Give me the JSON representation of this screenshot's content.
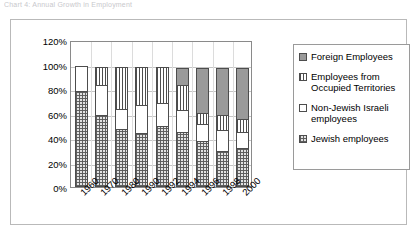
{
  "caption": {
    "text": "Chart 4: Annual Growth in Employment"
  },
  "chart_data": {
    "type": "bar",
    "subtype": "stacked-100",
    "title": "",
    "xlabel": "",
    "ylabel": "",
    "ylim": [
      0,
      120
    ],
    "ytick_labels": [
      "120%",
      "100%",
      "80%",
      "60%",
      "40%",
      "20%",
      "0%"
    ],
    "ytick_values": [
      120,
      100,
      80,
      60,
      40,
      20,
      0
    ],
    "grid": true,
    "legend_position": "right",
    "categories": [
      "1960",
      "1970",
      "1980",
      "1990",
      "1992",
      "1994",
      "1996",
      "1998",
      "2000"
    ],
    "series": [
      {
        "name": "Jewish employees",
        "pattern": "crosshatch-dotted",
        "color": "#e3e3e3",
        "values": [
          78.5,
          58.5,
          47.5,
          44.5,
          50.0,
          45.0,
          37.5,
          29.0,
          31.5
        ]
      },
      {
        "name": "Non-Jewish Israeli employees",
        "pattern": "solid-white",
        "color": "#ffffff",
        "values": [
          21.5,
          26.0,
          17.0,
          23.0,
          19.5,
          18.5,
          15.0,
          18.5,
          14.5
        ]
      },
      {
        "name": "Employees from Occupied Territories",
        "pattern": "vertical-stripes",
        "color": "#ffffff",
        "values": [
          0.0,
          15.5,
          35.5,
          32.5,
          30.5,
          21.5,
          9.5,
          13.0,
          11.0
        ]
      },
      {
        "name": "Foreign Employees",
        "pattern": "solid-gray",
        "color": "#9a9a9a",
        "values": [
          0.0,
          0.0,
          0.0,
          0.0,
          0.0,
          15.0,
          38.0,
          39.5,
          43.0
        ]
      }
    ]
  },
  "legend": {
    "items": [
      {
        "label": "Foreign Employees",
        "swatch": "solid-gray"
      },
      {
        "label": "Employees from\nOccupied Territories",
        "swatch": "vertical-stripes"
      },
      {
        "label": "Non-Jewish Israeli\nemployees",
        "swatch": "solid-white"
      },
      {
        "label": "Jewish employees",
        "swatch": "crosshatch-dotted"
      }
    ]
  }
}
